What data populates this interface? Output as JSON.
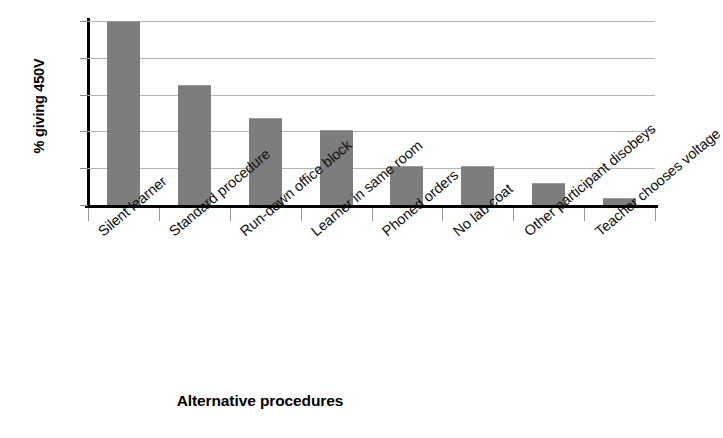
{
  "chart_data": {
    "type": "bar",
    "title": "",
    "xlabel": "Alternative procedures",
    "ylabel": "% giving 450V",
    "categories": [
      "Silent learner",
      "Standard procedure",
      "Run-down office block",
      "Learner in same room",
      "Phoned orders",
      "No lab coat",
      "Other participant disobeys",
      "Teacher chooses voltage"
    ],
    "values": [
      100,
      65,
      47.5,
      40.5,
      21,
      21,
      12,
      4
    ],
    "ylim": [
      0,
      100
    ],
    "yticks": [
      0,
      20,
      40,
      60,
      80,
      100
    ],
    "ytick_labels": [
      "0",
      "20",
      "40",
      "60",
      "80",
      "100"
    ],
    "grid": true,
    "legend": "none",
    "bar_color": "#7d7d7d",
    "grid_color": "#b3b3b3",
    "axis_color": "#000000"
  }
}
